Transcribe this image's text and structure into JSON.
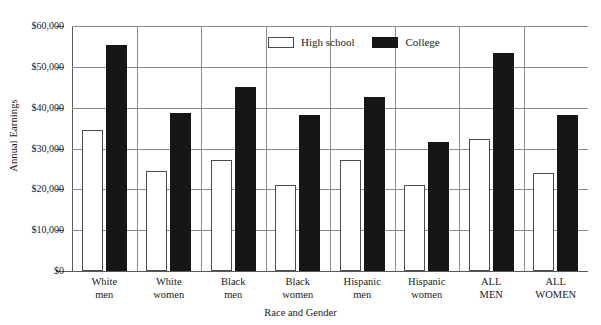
{
  "chart_data": {
    "type": "bar",
    "title": "",
    "xlabel": "Race and Gender",
    "ylabel": "Annual Earnings",
    "categories": [
      [
        "White",
        "men"
      ],
      [
        "White",
        "women"
      ],
      [
        "Black",
        "men"
      ],
      [
        "Black",
        "women"
      ],
      [
        "Hispanic",
        "men"
      ],
      [
        "Hispanic",
        "women"
      ],
      [
        "ALL",
        "MEN"
      ],
      [
        "ALL",
        "WOMEN"
      ]
    ],
    "series": [
      {
        "name": "High school",
        "style": "white-outline",
        "values": [
          34600,
          24500,
          27100,
          21100,
          27200,
          21000,
          32400,
          23900
        ]
      },
      {
        "name": "College",
        "style": "black-filled",
        "values": [
          55400,
          38600,
          45000,
          38100,
          42700,
          31700,
          53400,
          38100
        ]
      }
    ],
    "ylim": [
      0,
      60000
    ],
    "ytick_values": [
      0,
      10000,
      20000,
      30000,
      40000,
      50000,
      60000
    ],
    "ytick_labels": [
      "$0",
      "$10,000",
      "$20,000",
      "$30,000",
      "$40,000",
      "$50,000",
      "$60,000"
    ],
    "grid": true,
    "legend_position": "top-center",
    "colors": {
      "high_school_fill": "#ffffff",
      "high_school_stroke": "#4a4b4d",
      "college_fill": "#161616",
      "gridline": "#8a8b8d",
      "axis": "#58595b",
      "text": "#1a1a1a",
      "background": "#ffffff"
    }
  },
  "legend": {
    "items": [
      {
        "label": "High school",
        "swatch": "white-outline-swatch"
      },
      {
        "label": "College",
        "swatch": "black-filled-swatch"
      }
    ]
  }
}
